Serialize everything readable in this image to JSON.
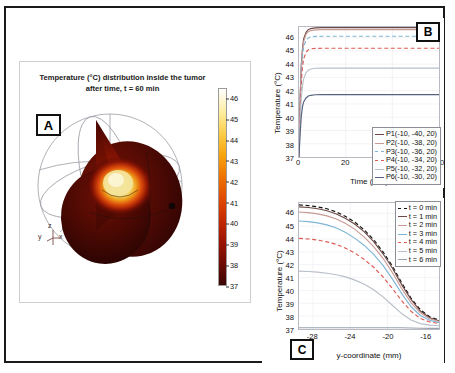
{
  "figure": {
    "panel_labels": {
      "a": "A",
      "b": "B",
      "c": "C"
    }
  },
  "panel_a": {
    "title_line1": "Temperature (°C) distribution inside the tumor",
    "title_line2": "after time, t = 60 min",
    "axis_triad": {
      "x": "x",
      "y": "y",
      "z": "z"
    },
    "colorbar": {
      "ticks": [
        "46",
        "45",
        "44",
        "43",
        "42",
        "41",
        "40",
        "39",
        "38",
        "37"
      ],
      "min": 37,
      "max": 46.5,
      "low_color": "#3a0505",
      "high_color": "#ffffff"
    }
  },
  "chart_data": [
    {
      "id": "panel_b",
      "type": "line",
      "title": "",
      "xlabel": "Time (min)",
      "ylabel": "Temperature (°C)",
      "xlim": [
        0,
        60
      ],
      "ylim": [
        37,
        46.8
      ],
      "xticks": [
        0,
        20,
        40,
        60
      ],
      "yticks": [
        37,
        38,
        39,
        40,
        41,
        42,
        43,
        44,
        45,
        46
      ],
      "grid": true,
      "legend_position": "lower right",
      "series": [
        {
          "name": "P1(-10, -40, 20)",
          "color": "#6b4a46",
          "dash": "none",
          "steady_value": 46.75,
          "tau": 1.5,
          "x": [
            0,
            0.5,
            1,
            1.5,
            2,
            3,
            4,
            5,
            7,
            10,
            15,
            20,
            30,
            40,
            50,
            60
          ],
          "values": [
            37.0,
            41.6,
            44.0,
            45.2,
            45.9,
            46.4,
            46.6,
            46.68,
            46.73,
            46.75,
            46.75,
            46.75,
            46.75,
            46.75,
            46.75,
            46.75
          ]
        },
        {
          "name": "P2(-10, -38, 20)",
          "color": "#c99a95",
          "dash": "none",
          "steady_value": 46.6,
          "tau": 1.6,
          "x": [
            0,
            0.5,
            1,
            1.5,
            2,
            3,
            4,
            5,
            7,
            10,
            15,
            20,
            30,
            40,
            50,
            60
          ],
          "values": [
            37.0,
            41.4,
            43.8,
            45.0,
            45.7,
            46.25,
            46.45,
            46.53,
            46.58,
            46.6,
            46.6,
            46.6,
            46.6,
            46.6,
            46.6,
            46.6
          ]
        },
        {
          "name": "P3(-10, -36, 20)",
          "color": "#7fb6d6",
          "dash": "dashed",
          "steady_value": 46.1,
          "tau": 1.7,
          "x": [
            0,
            0.5,
            1,
            1.5,
            2,
            3,
            4,
            5,
            7,
            10,
            15,
            20,
            30,
            40,
            50,
            60
          ],
          "values": [
            37.0,
            41.1,
            43.4,
            44.6,
            45.3,
            45.8,
            45.98,
            46.05,
            46.09,
            46.1,
            46.1,
            46.1,
            46.1,
            46.1,
            46.1,
            46.1
          ]
        },
        {
          "name": "P4(-10, -34, 20)",
          "color": "#dd5b55",
          "dash": "dashed",
          "steady_value": 45.2,
          "tau": 1.9,
          "x": [
            0,
            0.5,
            1,
            1.5,
            2,
            3,
            4,
            5,
            7,
            10,
            15,
            20,
            30,
            40,
            50,
            60
          ],
          "values": [
            37.0,
            40.6,
            42.7,
            43.8,
            44.4,
            44.9,
            45.08,
            45.15,
            45.19,
            45.2,
            45.2,
            45.2,
            45.2,
            45.2,
            45.2,
            45.2
          ]
        },
        {
          "name": "P5(-10, -32, 20)",
          "color": "#b9bfc9",
          "dash": "none",
          "steady_value": 43.7,
          "tau": 2.3,
          "x": [
            0,
            0.5,
            1,
            1.5,
            2,
            3,
            4,
            5,
            7,
            10,
            15,
            20,
            30,
            40,
            50,
            60
          ],
          "values": [
            37.0,
            39.8,
            41.5,
            42.4,
            42.9,
            43.35,
            43.55,
            43.63,
            43.69,
            43.7,
            43.7,
            43.7,
            43.7,
            43.7,
            43.7,
            43.7
          ]
        },
        {
          "name": "P6(-10, -30, 20)",
          "color": "#56627f",
          "dash": "none",
          "steady_value": 41.7,
          "tau": 3.0,
          "x": [
            0,
            0.5,
            1,
            1.5,
            2,
            3,
            4,
            5,
            7,
            10,
            15,
            20,
            30,
            40,
            50,
            60
          ],
          "values": [
            37.0,
            38.8,
            40.1,
            40.8,
            41.15,
            41.45,
            41.6,
            41.65,
            41.69,
            41.7,
            41.7,
            41.7,
            41.7,
            41.7,
            41.7,
            41.7
          ]
        }
      ]
    },
    {
      "id": "panel_c",
      "type": "line",
      "title": "",
      "xlabel": "y-coordinate (mm)",
      "ylabel": "Temperature (°C)",
      "xlim": [
        -29.5,
        -14.5
      ],
      "ylim": [
        37,
        46.8
      ],
      "xticks": [
        -28,
        -24,
        -20,
        -16
      ],
      "yticks": [
        37,
        38,
        39,
        40,
        41,
        42,
        43,
        44,
        45,
        46
      ],
      "grid": true,
      "legend_position": "upper right",
      "x": [
        -29.5,
        -28.5,
        -27.5,
        -26.5,
        -25.5,
        -24.5,
        -23.5,
        -22.5,
        -21.5,
        -20.5,
        -19.5,
        -18.5,
        -17.5,
        -16.5,
        -15.5,
        -14.5
      ],
      "series": [
        {
          "name": "t = 0 min",
          "color": "#111111",
          "dash": "dashed",
          "values": [
            46.65,
            46.6,
            46.5,
            46.35,
            46.1,
            45.75,
            45.3,
            44.7,
            43.95,
            43.0,
            41.9,
            40.6,
            39.4,
            38.5,
            37.95,
            37.7
          ]
        },
        {
          "name": "t = 1 min",
          "color": "#6b4a46",
          "dash": "none",
          "values": [
            46.5,
            46.45,
            46.35,
            46.2,
            45.95,
            45.6,
            45.15,
            44.55,
            43.8,
            42.85,
            41.75,
            40.45,
            39.3,
            38.4,
            37.88,
            37.64
          ]
        },
        {
          "name": "t = 2 min",
          "color": "#c99a95",
          "dash": "none",
          "values": [
            46.1,
            46.05,
            45.95,
            45.8,
            45.55,
            45.2,
            44.75,
            44.15,
            43.4,
            42.5,
            41.4,
            40.15,
            39.05,
            38.25,
            37.8,
            37.58
          ]
        },
        {
          "name": "t = 3 min",
          "color": "#7fb6d6",
          "dash": "none",
          "values": [
            45.4,
            45.35,
            45.25,
            45.1,
            44.85,
            44.5,
            44.05,
            43.5,
            42.8,
            41.95,
            40.9,
            39.75,
            38.75,
            38.05,
            37.68,
            37.5
          ]
        },
        {
          "name": "t = 4 min",
          "color": "#dd5b55",
          "dash": "dashed",
          "values": [
            44.05,
            44.0,
            43.92,
            43.78,
            43.58,
            43.28,
            42.9,
            42.4,
            41.8,
            41.05,
            40.15,
            39.2,
            38.38,
            37.82,
            37.55,
            37.42
          ]
        },
        {
          "name": "t = 5 min",
          "color": "#b9bfc9",
          "dash": "none",
          "values": [
            41.5,
            41.47,
            41.42,
            41.34,
            41.22,
            41.05,
            40.8,
            40.48,
            40.05,
            39.5,
            38.85,
            38.2,
            37.7,
            37.42,
            37.3,
            37.25
          ]
        },
        {
          "name": "t = 6 min",
          "color": "#9aa2b0",
          "dash": "none",
          "values": [
            37.1,
            37.1,
            37.1,
            37.1,
            37.1,
            37.1,
            37.1,
            37.1,
            37.1,
            37.1,
            37.1,
            37.1,
            37.08,
            37.06,
            37.05,
            37.05
          ]
        }
      ]
    }
  ]
}
